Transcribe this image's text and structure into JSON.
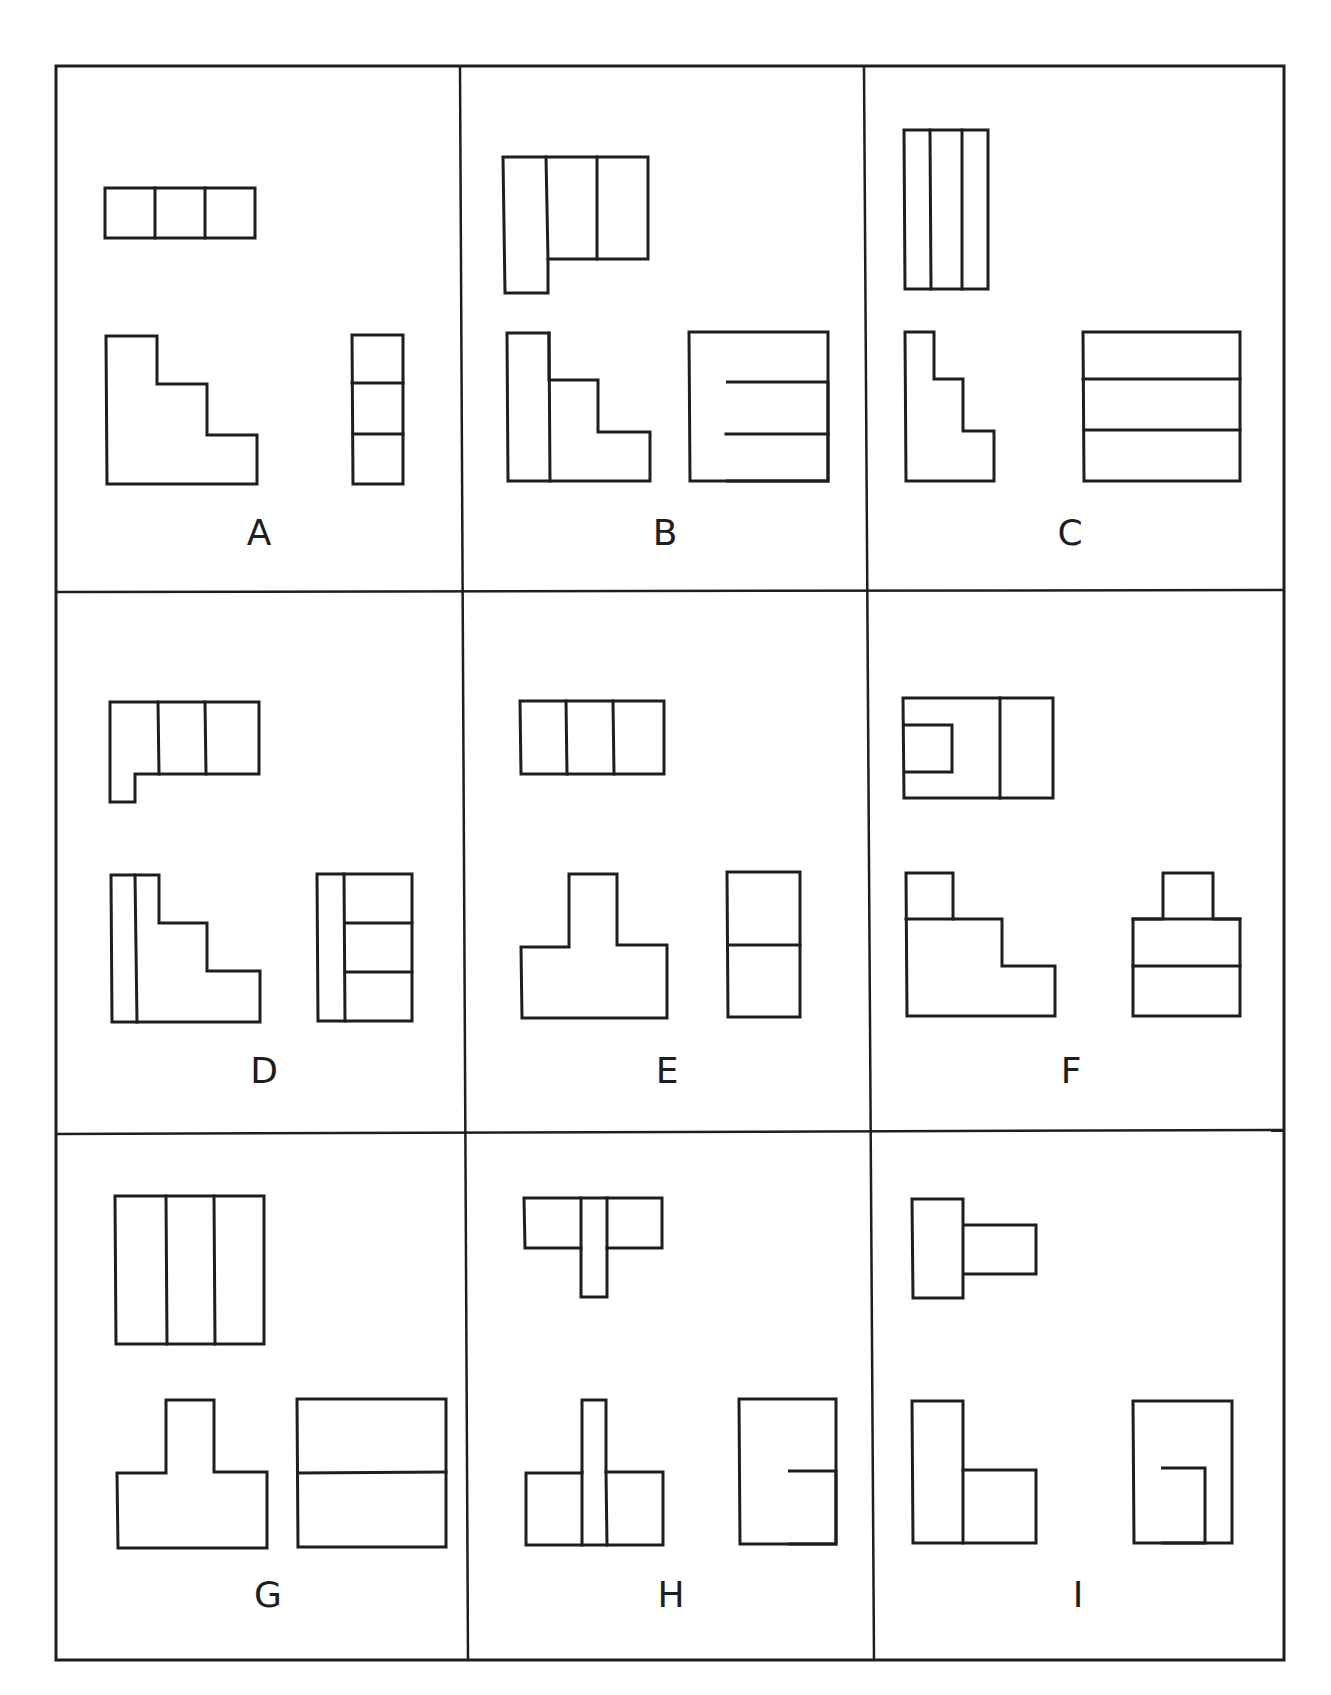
{
  "figure": {
    "view_names": [
      "top view",
      "front view",
      "side view"
    ],
    "line_color": "#1e1e1e",
    "background_color": "#ffffff"
  },
  "panels": [
    {
      "label": "A",
      "views": {
        "top": "three squares in a row",
        "front": "three-step staircase profile",
        "side": "three stacked squares"
      }
    },
    {
      "label": "B",
      "views": {
        "top": "tall left bar with two squares on the right",
        "front": "staircase with vertical divider",
        "side": "square frame with two inner stacked rectangles"
      }
    },
    {
      "label": "C",
      "views": {
        "top": "three tall vertical strips",
        "front": "narrow staircase profile",
        "side": "three horizontal bands"
      }
    },
    {
      "label": "D",
      "views": {
        "top": "three cells with a short tab at lower left",
        "front": "staircase with thin vertical strip",
        "side": "thin strip plus three stacked cells"
      }
    },
    {
      "label": "E",
      "views": {
        "top": "three squares in a row",
        "front": "inverted T profile",
        "side": "two stacked squares"
      }
    },
    {
      "label": "F",
      "views": {
        "top": "rectangle with inner notch and a divider",
        "front": "staircase with small block on top",
        "side": "small block on two stacked bands"
      }
    },
    {
      "label": "G",
      "views": {
        "top": "three tall vertical strips",
        "front": "inverted T profile",
        "side": "two horizontal bands"
      }
    },
    {
      "label": "H",
      "views": {
        "top": "T shape with a central stem",
        "front": "tall thin post through a wide block",
        "side": "frame with small inner rectangle at lower right"
      }
    },
    {
      "label": "I",
      "views": {
        "top": "tall rectangle with a smaller one attached at right",
        "front": "tall bar with lower block at right",
        "side": "frame with inner doorway shape"
      }
    }
  ]
}
